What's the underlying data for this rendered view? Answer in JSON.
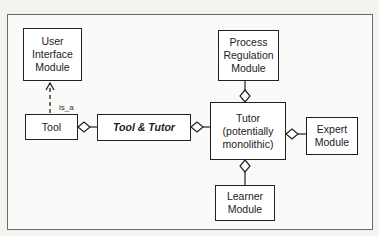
{
  "diagram": {
    "nodes": {
      "user_interface": {
        "label": "User\nInterface\nModule"
      },
      "tool": {
        "label": "Tool"
      },
      "tool_and_tutor": {
        "label": "Tool & Tutor"
      },
      "process_regulation": {
        "label": "Process\nRegulation\nModule"
      },
      "tutor": {
        "label": "Tutor\n(potentially\nmonolithic)"
      },
      "expert": {
        "label": "Expert\nModule"
      },
      "learner": {
        "label": "Learner\nModule"
      }
    },
    "edges": [
      {
        "from": "tool",
        "to": "user_interface",
        "type": "dashed-arrow",
        "label": "is_a"
      },
      {
        "from": "tool",
        "to": "tool_and_tutor",
        "type": "aggregation"
      },
      {
        "from": "tutor",
        "to": "tool_and_tutor",
        "type": "aggregation"
      },
      {
        "from": "process_regulation",
        "to": "tutor",
        "type": "aggregation"
      },
      {
        "from": "expert",
        "to": "tutor",
        "type": "aggregation"
      },
      {
        "from": "learner",
        "to": "tutor",
        "type": "aggregation"
      }
    ],
    "edge_labels": {
      "is_a": "is_a"
    }
  }
}
